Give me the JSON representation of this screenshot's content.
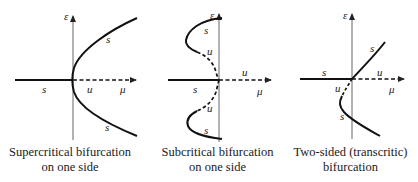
{
  "panels": [
    {
      "id": "supercritical",
      "caption": [
        "Supercritical bifurcation",
        "on one side"
      ],
      "axis_labels": {
        "vertical": "ε",
        "horizontal": "μ"
      },
      "branch_labels": {
        "left_axis": "s",
        "right_axis": "u",
        "upper": "s",
        "lower": "s"
      }
    },
    {
      "id": "subcritical",
      "caption": [
        "Subcritical bifurcation",
        "on one side"
      ],
      "axis_labels": {
        "vertical": "ε",
        "horizontal": "μ"
      },
      "branch_labels": {
        "left_axis": "s",
        "right_axis": "u",
        "upper_stable": "s",
        "upper_unstable": "u",
        "lower_unstable": "u",
        "lower_stable": "s"
      }
    },
    {
      "id": "transcritical",
      "caption": [
        "Two-sided (transcritic)",
        "bifurcation"
      ],
      "axis_labels": {
        "vertical": "ε",
        "horizontal": "μ"
      },
      "branch_labels": {
        "left_axis": "s",
        "right_axis": "u",
        "upper": "s",
        "lower_unstable": "u",
        "lower_stable": "s"
      }
    }
  ],
  "colors": {
    "axis": "#555555",
    "curve": "#111111"
  }
}
